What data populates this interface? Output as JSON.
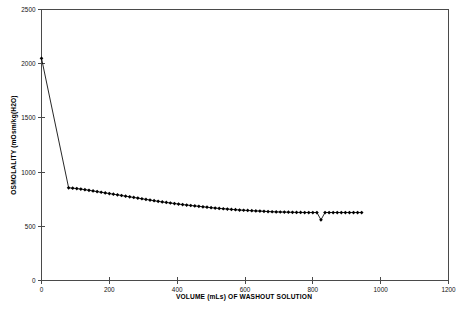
{
  "chart_data": {
    "type": "line",
    "title": "",
    "xlabel": "VOLUME (mLs) OF WASHOUT SOLUTION",
    "ylabel": "OSMOLALITY (mOsm/kg(H2O)",
    "xlim": [
      0,
      1200
    ],
    "ylim": [
      0,
      2500
    ],
    "xticks": [
      0,
      200,
      400,
      600,
      800,
      1000,
      1200
    ],
    "yticks": [
      0,
      500,
      1000,
      1500,
      2000,
      2500
    ],
    "grid": false,
    "legend": "none",
    "marker": "filled-diamond",
    "line_color": "#000000",
    "marker_color": "#000000",
    "series": [
      {
        "name": "Osmolality of washout effluent",
        "x": [
          0,
          80,
          92,
          104,
          116,
          128,
          140,
          152,
          164,
          176,
          188,
          200,
          212,
          224,
          236,
          248,
          260,
          272,
          284,
          296,
          308,
          320,
          332,
          344,
          356,
          368,
          380,
          392,
          404,
          416,
          428,
          440,
          452,
          464,
          476,
          488,
          500,
          512,
          524,
          536,
          548,
          560,
          572,
          584,
          596,
          608,
          620,
          632,
          644,
          656,
          668,
          680,
          692,
          704,
          716,
          728,
          740,
          752,
          764,
          776,
          788,
          800,
          812,
          824,
          836,
          848,
          860,
          872,
          884,
          896,
          908,
          920,
          932,
          944
        ],
        "y": [
          2050,
          855,
          852,
          848,
          843,
          838,
          832,
          826,
          820,
          814,
          808,
          802,
          796,
          790,
          784,
          778,
          772,
          766,
          760,
          754,
          748,
          742,
          736,
          730,
          725,
          720,
          715,
          710,
          705,
          700,
          696,
          692,
          688,
          684,
          680,
          676,
          672,
          668,
          665,
          662,
          659,
          656,
          653,
          650,
          648,
          646,
          644,
          642,
          640,
          638,
          636,
          634,
          633,
          632,
          631,
          630,
          629,
          628,
          628,
          627,
          627,
          627,
          627,
          560,
          627,
          627,
          627,
          627,
          627,
          627,
          627,
          627,
          627,
          627
        ]
      }
    ]
  }
}
